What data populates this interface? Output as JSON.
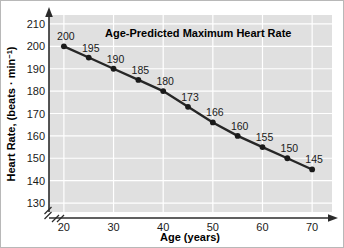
{
  "chart_data": {
    "type": "line",
    "title": "Age-Predicted Maximum Heart Rate",
    "xlabel": "Age (years)",
    "ylabel": "Heart Rate, (beats · min",
    "ylabel_sup": "−1",
    "ylabel_tail": ")",
    "x": [
      20,
      25,
      30,
      35,
      40,
      45,
      50,
      55,
      60,
      65,
      70
    ],
    "values": [
      200,
      195,
      190,
      185,
      180,
      173,
      166,
      160,
      155,
      150,
      145
    ],
    "point_labels": [
      "200",
      "195",
      "190",
      "185",
      "180",
      "173",
      "166",
      "160",
      "155",
      "150",
      "145"
    ],
    "xticks": [
      20,
      30,
      40,
      50,
      60,
      70
    ],
    "xtick_labels": [
      "20",
      "30",
      "40",
      "50",
      "60",
      "70"
    ],
    "yticks": [
      130,
      140,
      150,
      160,
      170,
      180,
      190,
      200,
      210
    ],
    "ytick_labels": [
      "130",
      "140",
      "150",
      "160",
      "170",
      "180",
      "190",
      "200",
      "210"
    ],
    "xlim": [
      17,
      74
    ],
    "ylim": [
      126,
      214
    ],
    "grid": true,
    "legend": "none",
    "axis_break": true,
    "colors": {
      "plot_background": "#e0e0e0",
      "gridline": "#ffffff",
      "line": "#262626",
      "marker": "#1a1a1a",
      "axis": "#2b2b2b",
      "text": "#1a1a1a",
      "page_background": "#ffffff"
    }
  }
}
